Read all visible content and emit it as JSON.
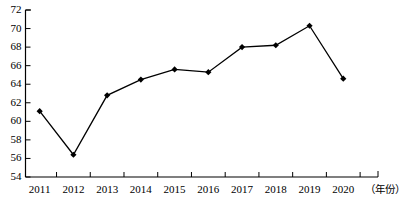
{
  "chart_data": {
    "type": "line",
    "title": "",
    "subtitle": "",
    "xlabel": "（年份）",
    "ylabel": "",
    "categories": [
      "2011",
      "2012",
      "2013",
      "2014",
      "2015",
      "2016",
      "2017",
      "2018",
      "2019",
      "2020"
    ],
    "values": [
      61.1,
      56.4,
      62.8,
      64.5,
      65.6,
      65.3,
      68.0,
      68.2,
      70.3,
      64.6
    ],
    "series": [
      {
        "name": "",
        "values": [
          61.1,
          56.4,
          62.8,
          64.5,
          65.6,
          65.3,
          68.0,
          68.2,
          70.3,
          64.6
        ]
      }
    ],
    "ylim": [
      54,
      72
    ],
    "y_ticks": [
      54,
      56,
      58,
      60,
      62,
      64,
      66,
      68,
      70,
      72
    ],
    "y_tick_labels": [
      "54",
      "56",
      "58",
      "60",
      "62",
      "64",
      "66",
      "68",
      "70",
      "72"
    ],
    "x_tick_labels": [
      "2011",
      "2012",
      "2013",
      "2014",
      "2015",
      "2016",
      "2017",
      "2018",
      "2019",
      "2020"
    ],
    "grid": false,
    "legend": "none",
    "marker": "diamond",
    "line_color": "#000000",
    "marker_color": "#000000",
    "axis_color": "#000000",
    "background_color": "#ffffff",
    "annotations": []
  },
  "axis": {
    "x_title": "（年份）"
  }
}
